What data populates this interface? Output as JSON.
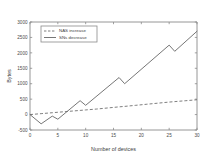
{
  "chart_data": {
    "type": "line",
    "title": "",
    "xlabel": "Number of devices",
    "ylabel": "Bytes",
    "xlim": [
      0,
      30
    ],
    "ylim": [
      -500,
      3000
    ],
    "xticks": [
      0,
      5,
      10,
      15,
      20,
      25,
      30
    ],
    "xticklabels": [
      "0",
      "5",
      "10",
      "15",
      "20",
      "25",
      "30"
    ],
    "yticks": [
      -500,
      0,
      500,
      1000,
      1500,
      2000,
      2500,
      3000
    ],
    "yticklabels": [
      "-500",
      "0",
      "500",
      "1000",
      "1500",
      "2000",
      "2500",
      "3000"
    ],
    "grid": false,
    "legend_position": "upper-left",
    "series": [
      {
        "name": "NAS increase",
        "style": "dashed",
        "color": "#6f6f6f",
        "x": [
          0,
          2,
          4,
          5,
          7,
          9,
          10,
          12,
          14,
          16,
          17,
          19,
          21,
          23,
          25,
          26,
          28,
          30
        ],
        "values": [
          0,
          30,
          60,
          75,
          105,
          135,
          150,
          180,
          215,
          250,
          265,
          300,
          335,
          370,
          405,
          420,
          450,
          480
        ]
      },
      {
        "name": "SNs decrease",
        "style": "solid",
        "color": "#6f6f6f",
        "x": [
          0,
          2,
          4,
          5,
          9,
          10,
          16,
          17,
          25,
          26,
          30
        ],
        "values": [
          0,
          -300,
          -50,
          -150,
          450,
          300,
          1200,
          1000,
          2250,
          2050,
          2700
        ]
      }
    ],
    "legend": [
      {
        "label": "NAS increase",
        "style": "dashed"
      },
      {
        "label": "SNs decrease",
        "style": "solid"
      }
    ]
  }
}
